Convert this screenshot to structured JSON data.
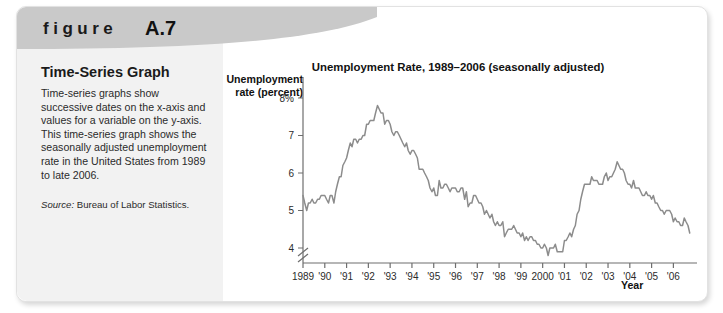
{
  "figure": {
    "kicker": "figure",
    "number": "A.7",
    "caption_title": "Time-Series Graph",
    "caption_body": "Time-series graphs show successive dates on the x-axis and values for a variable on the y-axis. This time-series graph shows the seasonally adjusted unemployment rate in the United States from 1989 to late 2006.",
    "source_label": "Source:",
    "source_text": "Bureau of Labor Statistics."
  },
  "colors": {
    "panel_background": "#f2f2f2",
    "header_band": "#c9c9c9",
    "line": "#8c8c8c",
    "axis": "#6e6e6e",
    "text": "#1a1a1a"
  },
  "chart_data": {
    "type": "line",
    "title": "Unemployment Rate, 1989–2006 (seasonally adjusted)",
    "xlabel": "Year",
    "ylabel": "Unemployment rate (percent)",
    "ylim": [
      3.6,
      8.4
    ],
    "yticks": [
      4,
      5,
      6,
      7,
      8
    ],
    "ytick_labels": [
      "4",
      "5",
      "6",
      "7",
      "8%"
    ],
    "y_axis_break": true,
    "grid": false,
    "legend": null,
    "xlim": [
      1989.0,
      2006.9
    ],
    "xticks": [
      1989,
      1990,
      1991,
      1992,
      1993,
      1994,
      1995,
      1996,
      1997,
      1998,
      1999,
      2000,
      2001,
      2002,
      2003,
      2004,
      2005,
      2006
    ],
    "xtick_labels": [
      "1989",
      "'90",
      "'91",
      "'92",
      "'93",
      "'94",
      "'95",
      "'96",
      "'97",
      "'98",
      "'99",
      "2000",
      "'01",
      "'02",
      "'03",
      "'04",
      "'05",
      "'06"
    ],
    "series": [
      {
        "name": "Unemployment rate (percent), seasonally adjusted",
        "x": [
          1989.0,
          1989.08,
          1989.17,
          1989.25,
          1989.33,
          1989.42,
          1989.5,
          1989.58,
          1989.67,
          1989.75,
          1989.83,
          1989.92,
          1990.0,
          1990.08,
          1990.17,
          1990.25,
          1990.33,
          1990.42,
          1990.5,
          1990.58,
          1990.67,
          1990.75,
          1990.83,
          1990.92,
          1991.0,
          1991.08,
          1991.17,
          1991.25,
          1991.33,
          1991.42,
          1991.5,
          1991.58,
          1991.67,
          1991.75,
          1991.83,
          1991.92,
          1992.0,
          1992.08,
          1992.17,
          1992.25,
          1992.33,
          1992.42,
          1992.5,
          1992.58,
          1992.67,
          1992.75,
          1992.83,
          1992.92,
          1993.0,
          1993.08,
          1993.17,
          1993.25,
          1993.33,
          1993.42,
          1993.5,
          1993.58,
          1993.67,
          1993.75,
          1993.83,
          1993.92,
          1994.0,
          1994.08,
          1994.17,
          1994.25,
          1994.33,
          1994.42,
          1994.5,
          1994.58,
          1994.67,
          1994.75,
          1994.83,
          1994.92,
          1995.0,
          1995.08,
          1995.17,
          1995.25,
          1995.33,
          1995.42,
          1995.5,
          1995.58,
          1995.67,
          1995.75,
          1995.83,
          1995.92,
          1996.0,
          1996.08,
          1996.17,
          1996.25,
          1996.33,
          1996.42,
          1996.5,
          1996.58,
          1996.67,
          1996.75,
          1996.83,
          1996.92,
          1997.0,
          1997.08,
          1997.17,
          1997.25,
          1997.33,
          1997.42,
          1997.5,
          1997.58,
          1997.67,
          1997.75,
          1997.83,
          1997.92,
          1998.0,
          1998.08,
          1998.17,
          1998.25,
          1998.33,
          1998.42,
          1998.5,
          1998.58,
          1998.67,
          1998.75,
          1998.83,
          1998.92,
          1999.0,
          1999.08,
          1999.17,
          1999.25,
          1999.33,
          1999.42,
          1999.5,
          1999.58,
          1999.67,
          1999.75,
          1999.83,
          1999.92,
          2000.0,
          2000.08,
          2000.17,
          2000.25,
          2000.33,
          2000.42,
          2000.5,
          2000.58,
          2000.67,
          2000.75,
          2000.83,
          2000.92,
          2001.0,
          2001.08,
          2001.17,
          2001.25,
          2001.33,
          2001.42,
          2001.5,
          2001.58,
          2001.67,
          2001.75,
          2001.83,
          2001.92,
          2002.0,
          2002.08,
          2002.17,
          2002.25,
          2002.33,
          2002.42,
          2002.5,
          2002.58,
          2002.67,
          2002.75,
          2002.83,
          2002.92,
          2003.0,
          2003.08,
          2003.17,
          2003.25,
          2003.33,
          2003.42,
          2003.5,
          2003.58,
          2003.67,
          2003.75,
          2003.83,
          2003.92,
          2004.0,
          2004.08,
          2004.17,
          2004.25,
          2004.33,
          2004.42,
          2004.5,
          2004.58,
          2004.67,
          2004.75,
          2004.83,
          2004.92,
          2005.0,
          2005.08,
          2005.17,
          2005.25,
          2005.33,
          2005.42,
          2005.5,
          2005.58,
          2005.67,
          2005.75,
          2005.83,
          2005.92,
          2006.0,
          2006.08,
          2006.17,
          2006.25,
          2006.33,
          2006.42,
          2006.5,
          2006.58,
          2006.67,
          2006.75
        ],
        "values": [
          5.4,
          5.2,
          5.0,
          5.2,
          5.2,
          5.3,
          5.2,
          5.2,
          5.3,
          5.3,
          5.4,
          5.4,
          5.4,
          5.3,
          5.2,
          5.4,
          5.4,
          5.2,
          5.5,
          5.7,
          5.9,
          5.9,
          6.2,
          6.3,
          6.4,
          6.6,
          6.8,
          6.7,
          6.9,
          6.9,
          6.8,
          6.9,
          6.9,
          7.0,
          7.0,
          7.3,
          7.3,
          7.4,
          7.4,
          7.4,
          7.6,
          7.8,
          7.7,
          7.6,
          7.6,
          7.3,
          7.4,
          7.4,
          7.3,
          7.1,
          7.0,
          7.1,
          7.1,
          7.0,
          6.9,
          6.8,
          6.7,
          6.8,
          6.6,
          6.5,
          6.6,
          6.6,
          6.5,
          6.4,
          6.1,
          6.1,
          6.1,
          6.0,
          5.9,
          5.8,
          5.6,
          5.5,
          5.6,
          5.4,
          5.4,
          5.8,
          5.6,
          5.6,
          5.7,
          5.7,
          5.6,
          5.5,
          5.6,
          5.6,
          5.6,
          5.5,
          5.5,
          5.6,
          5.6,
          5.3,
          5.5,
          5.1,
          5.2,
          5.2,
          5.4,
          5.4,
          5.3,
          5.2,
          5.2,
          5.1,
          4.9,
          5.0,
          4.9,
          4.8,
          4.9,
          4.7,
          4.6,
          4.7,
          4.6,
          4.6,
          4.7,
          4.3,
          4.4,
          4.5,
          4.5,
          4.5,
          4.6,
          4.5,
          4.4,
          4.4,
          4.3,
          4.4,
          4.2,
          4.3,
          4.2,
          4.3,
          4.3,
          4.2,
          4.2,
          4.1,
          4.1,
          4.0,
          4.0,
          4.1,
          4.0,
          3.8,
          4.0,
          4.0,
          4.0,
          4.1,
          3.9,
          3.9,
          3.9,
          3.9,
          4.2,
          4.2,
          4.3,
          4.4,
          4.3,
          4.5,
          4.6,
          4.9,
          5.0,
          5.3,
          5.5,
          5.7,
          5.7,
          5.7,
          5.7,
          5.9,
          5.8,
          5.8,
          5.8,
          5.7,
          5.7,
          5.7,
          5.9,
          6.0,
          5.8,
          5.9,
          5.9,
          6.0,
          6.1,
          6.3,
          6.2,
          6.1,
          6.1,
          6.0,
          5.8,
          5.7,
          5.7,
          5.6,
          5.8,
          5.6,
          5.6,
          5.6,
          5.5,
          5.4,
          5.4,
          5.5,
          5.4,
          5.4,
          5.3,
          5.4,
          5.2,
          5.2,
          5.1,
          5.0,
          5.0,
          4.9,
          5.0,
          5.0,
          5.0,
          4.9,
          4.7,
          4.8,
          4.7,
          4.7,
          4.6,
          4.6,
          4.8,
          4.7,
          4.6,
          4.4
        ]
      }
    ]
  }
}
